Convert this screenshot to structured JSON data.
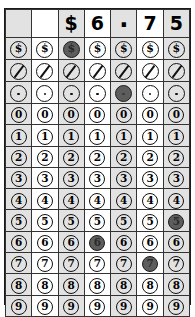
{
  "worksheet": {
    "type": "gridded-response-answer-grid",
    "title": "Money gridded response bubble grid",
    "answer_text": "$6.75",
    "columns": 7,
    "header": {
      "cells": [
        "",
        "",
        "$",
        "6",
        ".",
        "7",
        "5"
      ]
    },
    "symbol_rows": [
      {
        "name": "dollar-sign-row",
        "symbol": "$",
        "icon": "dollar-sign-icon",
        "filled_columns": [
          2
        ]
      },
      {
        "name": "fraction-bar-row",
        "symbol": "/",
        "icon": "slash-icon",
        "filled_columns": []
      },
      {
        "name": "decimal-point-row",
        "symbol": ".",
        "icon": "dot-icon",
        "filled_columns": [
          4
        ]
      }
    ],
    "digit_rows": [
      {
        "digit": "0",
        "filled_columns": []
      },
      {
        "digit": "1",
        "filled_columns": []
      },
      {
        "digit": "2",
        "filled_columns": []
      },
      {
        "digit": "3",
        "filled_columns": []
      },
      {
        "digit": "4",
        "filled_columns": []
      },
      {
        "digit": "5",
        "filled_columns": [
          6
        ]
      },
      {
        "digit": "6",
        "filled_columns": [
          3
        ]
      },
      {
        "digit": "7",
        "filled_columns": [
          5
        ]
      },
      {
        "digit": "8",
        "filled_columns": []
      },
      {
        "digit": "9",
        "filled_columns": []
      }
    ],
    "shaded_columns": [
      0,
      2,
      4,
      6
    ],
    "colors": {
      "bubble_filled": "#5d5d5d",
      "bubble_outline": "#111111",
      "column_shade": "#e2e2e2",
      "grid_line": "#333333",
      "border": "#1a1a1a",
      "background": "#ffffff"
    }
  }
}
